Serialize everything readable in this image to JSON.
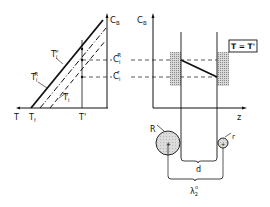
{
  "left_panel": {
    "y_axis_label": "C",
    "y_axis_sub": "B",
    "x_axis_labels": {
      "T": "T",
      "Tf": "T",
      "Tf_sub": "f",
      "Tprime": "T'"
    },
    "curves": [
      {
        "label": "T",
        "sub": "l",
        "sup": "∞"
      },
      {
        "label": "T",
        "sub": "l",
        "sup": "R"
      },
      {
        "label": "T",
        "sub": "l",
        "sup": "r"
      }
    ],
    "levels": [
      {
        "label": "C",
        "sub": "l",
        "sup": "R"
      },
      {
        "label": "C",
        "sub": "l",
        "sup": "r"
      }
    ]
  },
  "right_panel": {
    "y_axis_label": "C",
    "y_axis_sub": "B",
    "x_axis_label": "z",
    "condition_box": "T = T'",
    "particles": {
      "large": "R",
      "small": "r"
    },
    "distance_label": "d",
    "wavelength_label": "λ",
    "wavelength_sub": "2",
    "wavelength_sup": "o"
  }
}
